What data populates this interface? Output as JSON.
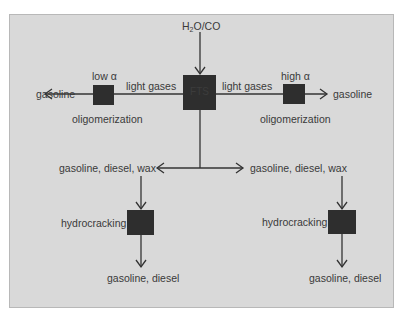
{
  "diagram": {
    "colors": {
      "background": "#d9d9d9",
      "box_fill": "#2e2e2e",
      "line": "#333333",
      "text": "#3a3a3a"
    },
    "center": {
      "input_label_main": "H",
      "input_label_sub": "2",
      "input_label_rest": "O/CO",
      "box_label": "FTS"
    },
    "left_branch": {
      "alpha_label": "low α",
      "gases_label": "light gases",
      "process_label": "oligomerization",
      "output_label": "gasoline"
    },
    "right_branch": {
      "alpha_label": "high α",
      "gases_label": "light gases",
      "process_label": "oligomerization",
      "output_label": "gasoline"
    },
    "lower_left": {
      "feed_label": "gasoline, diesel, wax",
      "process_label": "hydrocracking",
      "output_label": "gasoline, diesel"
    },
    "lower_right": {
      "feed_label": "gasoline, diesel, wax",
      "process_label": "hydrocracking",
      "output_label": "gasoline, diesel"
    }
  }
}
